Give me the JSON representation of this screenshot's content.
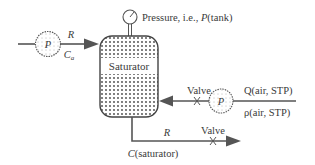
{
  "diagram": {
    "tank": {
      "label": "Saturator"
    },
    "gauge": {
      "label_prefix": "Pressure, i.e., ",
      "label_var": "P",
      "label_suffix": "(tank)"
    },
    "inlet": {
      "pump_label": "P",
      "rate_label": "R",
      "conc_label_main": "C",
      "conc_label_sub": "a"
    },
    "air_line": {
      "valve_label": "Valve",
      "pump_label": "P",
      "flow_label": "Q(air, STP)",
      "density_label": "ρ(air, STP)"
    },
    "outlet": {
      "rate_label": "R",
      "valve_label": "Valve",
      "conc_label": "C(saturator)"
    },
    "colors": {
      "line": "#555555",
      "text": "#3a3a3a",
      "dots": "#444444"
    }
  }
}
